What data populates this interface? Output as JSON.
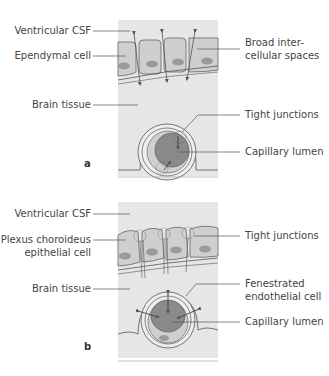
{
  "panel_a": {
    "letter": "a",
    "labels_left": {
      "ventricular_csf": "Ventricular CSF",
      "ependymal_cell": "Ependymal cell",
      "brain_tissue": "Brain tissue"
    },
    "labels_right": {
      "broad_intercellular_1": "Broad inter-",
      "broad_intercellular_2": "cellular spaces",
      "tight_junctions": "Tight junctions",
      "capillary_lumen": "Capillary lumen"
    }
  },
  "panel_b": {
    "letter": "b",
    "labels_left": {
      "ventricular_csf": "Ventricular CSF",
      "plexus_1": "Plexus choroideus",
      "plexus_2": "epithelial cell",
      "brain_tissue": "Brain tissue"
    },
    "labels_right": {
      "tight_junctions": "Tight junctions",
      "fenestrated_1": "Fenestrated",
      "fenestrated_2": "endothelial cell",
      "capillary_lumen": "Capillary lumen"
    }
  },
  "colors": {
    "background_panel": "#e6e6e6",
    "cell_fill": "#cfcfcf",
    "nucleus": "#9a9a9a",
    "lumen": "#8a8a8a",
    "line": "#555555"
  }
}
